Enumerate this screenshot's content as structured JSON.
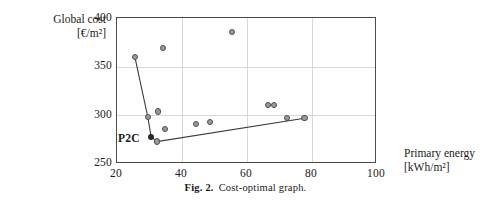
{
  "figure": {
    "caption_label": "Fig. 2.",
    "caption_text": "Cost-optimal graph."
  },
  "axes": {
    "y_title_line1": "Global cost",
    "y_title_line2": "[€/m²]",
    "x_title_line1": "Primary energy",
    "x_title_line2": "[kWh/m²]",
    "y_ticks": [
      "400",
      "350",
      "300",
      "250"
    ],
    "x_ticks": [
      "20",
      "40",
      "60",
      "80",
      "100"
    ]
  },
  "annotations": [
    {
      "label": "P2C",
      "x": 29.5,
      "y": 277
    }
  ],
  "chart_data": {
    "type": "scatter",
    "title": "Cost-optimal graph",
    "xlabel": "Primary energy [kWh/m²]",
    "ylabel": "Global cost [€/m²]",
    "xlim": [
      20,
      100
    ],
    "ylim": [
      250,
      400
    ],
    "xticks": [
      20,
      40,
      60,
      80,
      100
    ],
    "yticks": [
      250,
      300,
      350,
      400
    ],
    "grid": true,
    "legend": null,
    "x_unit": "kWh/m2",
    "y_unit": "EUR/m2",
    "points": [
      {
        "x": 25.8,
        "y": 359,
        "marker": "open"
      },
      {
        "x": 34.5,
        "y": 368,
        "marker": "open"
      },
      {
        "x": 55.7,
        "y": 385,
        "marker": "open"
      },
      {
        "x": 29.8,
        "y": 297,
        "marker": "open"
      },
      {
        "x": 33.0,
        "y": 303,
        "marker": "open"
      },
      {
        "x": 35.0,
        "y": 285,
        "marker": "open"
      },
      {
        "x": 30.8,
        "y": 277,
        "marker": "filled"
      },
      {
        "x": 32.6,
        "y": 272,
        "marker": "open"
      },
      {
        "x": 44.6,
        "y": 290,
        "marker": "open"
      },
      {
        "x": 48.9,
        "y": 292,
        "marker": "open"
      },
      {
        "x": 66.8,
        "y": 310,
        "marker": "open"
      },
      {
        "x": 68.6,
        "y": 310,
        "marker": "open"
      },
      {
        "x": 72.5,
        "y": 296,
        "marker": "open"
      },
      {
        "x": 78.0,
        "y": 296,
        "marker": "open"
      }
    ],
    "envelope": {
      "name": "cost-optimal curve",
      "vertices": [
        {
          "x": 25.8,
          "y": 359
        },
        {
          "x": 29.8,
          "y": 297
        },
        {
          "x": 30.8,
          "y": 277
        },
        {
          "x": 32.6,
          "y": 272
        },
        {
          "x": 78.0,
          "y": 296
        }
      ]
    }
  }
}
